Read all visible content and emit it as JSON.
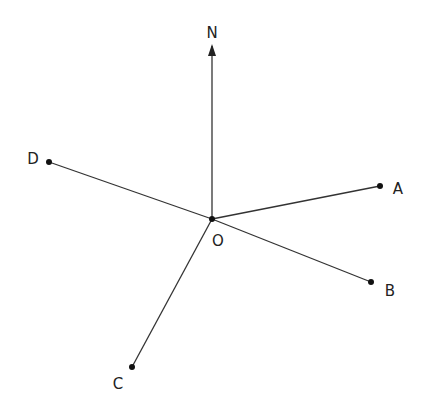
{
  "diagram": {
    "title": "",
    "origin": {
      "label": "O",
      "x": 212,
      "y": 219
    },
    "north": {
      "label": "N",
      "tip_x": 212,
      "tip_y": 44
    },
    "points": [
      {
        "label": "A",
        "x": 380,
        "y": 186
      },
      {
        "label": "B",
        "x": 371,
        "y": 282
      },
      {
        "label": "C",
        "x": 132,
        "y": 367
      },
      {
        "label": "D",
        "x": 49,
        "y": 162
      }
    ],
    "colors": {
      "line": "#333333",
      "text": "#222222"
    }
  }
}
